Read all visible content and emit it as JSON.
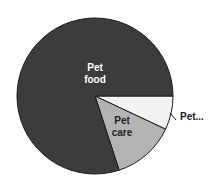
{
  "chart_data": {
    "type": "pie",
    "title": "",
    "start_angle_deg": 0,
    "direction": "clockwise",
    "slices": [
      {
        "label": "Pet...",
        "value": 7,
        "color": "#f2f2f2",
        "label_position": "outside"
      },
      {
        "label": "Pet care",
        "value": 13,
        "color": "#b3b3b3",
        "label_position": "inside"
      },
      {
        "label": "Pet food",
        "value": 80,
        "color": "#3c3c3c",
        "label_position": "inside"
      }
    ],
    "legend": "none"
  },
  "labels": {
    "pet_food_line1": "Pet",
    "pet_food_line2": "food",
    "pet_care_line1": "Pet",
    "pet_care_line2": "care",
    "pet_other": "Pet..."
  }
}
